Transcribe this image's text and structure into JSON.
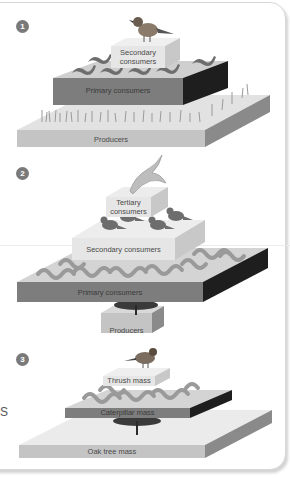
{
  "figure": {
    "panels": [
      {
        "number": "1",
        "title": "Pyramid of numbers (grassland)",
        "levels": [
          {
            "label": "Secondary consumers",
            "line1": "Secondary",
            "line2": "consumers",
            "organism": "thrush",
            "count_icons": 1
          },
          {
            "label": "Primary consumers",
            "organism": "slug",
            "count_icons": 6
          },
          {
            "label": "Producers",
            "organism": "grass"
          }
        ]
      },
      {
        "number": "2",
        "title": "Inverted pyramid of numbers (oak tree)",
        "levels": [
          {
            "label": "Tertiary consumers",
            "line1": "Tertiary",
            "line2": "consumers",
            "organism": "hawk",
            "count_icons": 1
          },
          {
            "label": "Secondary consumers",
            "organism": "thrush",
            "count_icons": 4
          },
          {
            "label": "Primary consumers",
            "organism": "caterpillar",
            "count_icons": 12
          },
          {
            "label": "Producers",
            "organism": "oak tree",
            "count_icons": 1
          }
        ]
      },
      {
        "number": "3",
        "title": "Pyramid of biomass",
        "levels": [
          {
            "label": "Thrush mass",
            "organism": "thrush"
          },
          {
            "label": "Caterpillar mass",
            "organism": "caterpillar"
          },
          {
            "label": "Oak tree mass",
            "organism": "oak tree"
          }
        ]
      }
    ],
    "edge_text": "S"
  },
  "colors": {
    "light_block": "#e6e6e6",
    "light_block_side": "#c8c8c8",
    "mid_block_front": "#7d7d7d",
    "mid_block_side": "#1e1e1e",
    "base_front": "#c4c4c4",
    "base_top": "#e2e2e2",
    "base_side": "#8a8a8a",
    "badge": "#7a7a7a"
  }
}
